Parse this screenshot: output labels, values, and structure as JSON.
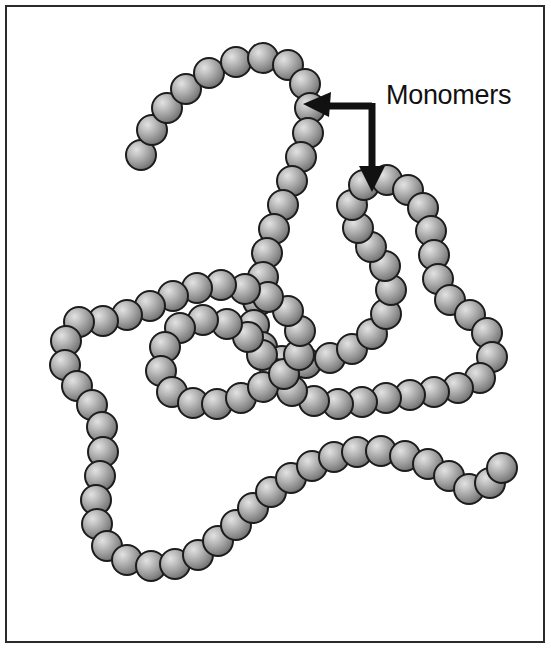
{
  "figure": {
    "background_color": "#ffffff",
    "border_color": "#2b2b2b",
    "border_width_px": 2
  },
  "annotation": {
    "label": "Monomers",
    "label_color": "#111111",
    "arrow_color": "#111111",
    "arrow_kind": "elbow-double-headed",
    "left_arrow_target": "chain-bead-upper-right",
    "down_arrow_target": "chain-bead-mid-right"
  },
  "monomer_style": {
    "diameter_px": 30,
    "fill_light": "#d8d8d8",
    "fill_mid": "#9a9a9a",
    "fill_dark": "#6e6e6e",
    "outline_color": "#1c1c1c",
    "outline_width_px": 2,
    "highlight_offset_pct": [
      35,
      32
    ]
  },
  "chain": {
    "name": "polymer-chain",
    "monomer_count": 96,
    "points": [
      [
        141,
        155
      ],
      [
        152,
        130
      ],
      [
        167,
        108
      ],
      [
        186,
        89
      ],
      [
        209,
        73
      ],
      [
        236,
        62
      ],
      [
        263,
        58
      ],
      [
        288,
        65
      ],
      [
        305,
        84
      ],
      [
        310,
        108
      ],
      [
        308,
        133
      ],
      [
        301,
        157
      ],
      [
        292,
        181
      ],
      [
        283,
        205
      ],
      [
        274,
        229
      ],
      [
        267,
        253
      ],
      [
        263,
        277
      ],
      [
        258,
        301
      ],
      [
        254,
        325
      ],
      [
        262,
        347
      ],
      [
        282,
        361
      ],
      [
        306,
        363
      ],
      [
        330,
        358
      ],
      [
        352,
        349
      ],
      [
        372,
        334
      ],
      [
        386,
        314
      ],
      [
        391,
        290
      ],
      [
        385,
        266
      ],
      [
        371,
        247
      ],
      [
        358,
        228
      ],
      [
        352,
        205
      ],
      [
        364,
        185
      ],
      [
        387,
        180
      ],
      [
        408,
        190
      ],
      [
        423,
        208
      ],
      [
        431,
        231
      ],
      [
        434,
        255
      ],
      [
        438,
        279
      ],
      [
        450,
        300
      ],
      [
        470,
        315
      ],
      [
        487,
        333
      ],
      [
        492,
        357
      ],
      [
        480,
        378
      ],
      [
        458,
        388
      ],
      [
        434,
        392
      ],
      [
        410,
        395
      ],
      [
        386,
        398
      ],
      [
        362,
        402
      ],
      [
        338,
        404
      ],
      [
        314,
        401
      ],
      [
        292,
        391
      ],
      [
        275,
        374
      ],
      [
        262,
        355
      ],
      [
        248,
        337
      ],
      [
        227,
        324
      ],
      [
        203,
        320
      ],
      [
        180,
        328
      ],
      [
        165,
        347
      ],
      [
        161,
        371
      ],
      [
        172,
        392
      ],
      [
        193,
        403
      ],
      [
        217,
        404
      ],
      [
        241,
        398
      ],
      [
        263,
        387
      ],
      [
        284,
        374
      ],
      [
        299,
        355
      ],
      [
        300,
        331
      ],
      [
        288,
        311
      ],
      [
        268,
        297
      ],
      [
        245,
        289
      ],
      [
        221,
        285
      ],
      [
        197,
        288
      ],
      [
        173,
        296
      ],
      [
        150,
        306
      ],
      [
        127,
        315
      ],
      [
        103,
        321
      ],
      [
        79,
        322
      ],
      [
        66,
        341
      ],
      [
        65,
        365
      ],
      [
        77,
        386
      ],
      [
        92,
        405
      ],
      [
        102,
        427
      ],
      [
        103,
        452
      ],
      [
        100,
        476
      ],
      [
        96,
        500
      ],
      [
        97,
        524
      ],
      [
        107,
        546
      ],
      [
        127,
        560
      ],
      [
        151,
        566
      ],
      [
        175,
        564
      ],
      [
        198,
        555
      ],
      [
        218,
        541
      ],
      [
        236,
        525
      ],
      [
        253,
        508
      ],
      [
        271,
        492
      ],
      [
        291,
        478
      ],
      [
        312,
        466
      ],
      [
        334,
        457
      ],
      [
        357,
        452
      ],
      [
        381,
        451
      ],
      [
        405,
        456
      ],
      [
        428,
        464
      ],
      [
        449,
        476
      ],
      [
        469,
        489
      ],
      [
        490,
        483
      ],
      [
        502,
        468
      ]
    ]
  }
}
